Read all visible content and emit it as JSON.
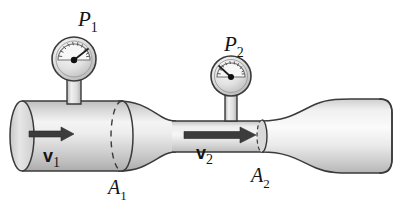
{
  "figure": {
    "background_color": "#ffffff",
    "width": 406,
    "height": 215
  },
  "labels": {
    "pressure_1": {
      "symbol": "P",
      "subscript": "1",
      "x": 78,
      "y": 22
    },
    "pressure_2": {
      "symbol": "P",
      "subscript": "2",
      "x": 224,
      "y": 47
    },
    "velocity_1": {
      "symbol": "v",
      "subscript": "1",
      "x": 43,
      "y": 160
    },
    "velocity_2": {
      "symbol": "v",
      "subscript": "2",
      "x": 196,
      "y": 157
    },
    "area_1": {
      "symbol": "A",
      "subscript": "1",
      "x": 108,
      "y": 190
    },
    "area_2": {
      "symbol": "A",
      "subscript": "2",
      "x": 253,
      "y": 178
    }
  },
  "gauges": [
    {
      "name": "pressure-gauge-1",
      "center_x": 74,
      "center_y": 59,
      "radius": 22,
      "needle_angle_deg": -35,
      "reading": "high",
      "stem_x": 74,
      "stem_top": 79,
      "stem_bottom": 104,
      "stem_half_width": 7
    },
    {
      "name": "pressure-gauge-2",
      "center_x": 231,
      "center_y": 76,
      "radius": 20,
      "needle_angle_deg": -145,
      "reading": "low",
      "stem_x": 231,
      "stem_top": 94,
      "stem_bottom": 120,
      "stem_half_width": 6
    }
  ],
  "pipe": {
    "fill_light": "#f2f2f2",
    "fill_mid": "#d8d8d8",
    "fill_dark": "#b4b4b4",
    "outline_color": "#3a3a3a",
    "wide_left_end_x": 22,
    "wide_section_right_x": 122,
    "wide_top_y": 101,
    "wide_bottom_y": 171,
    "throat_left_x": 172,
    "throat_right_x": 262,
    "throat_top_y": 121,
    "throat_bottom_y": 152,
    "flare_right_x": 392,
    "flare_top_y": 99,
    "flare_bottom_y": 173
  },
  "cross_sections": [
    {
      "name": "cross-section-a1",
      "cx": 122,
      "cy": 136,
      "rx": 11,
      "ry": 35,
      "front_style": "solid",
      "back_style": "dashed"
    },
    {
      "name": "cross-section-a2",
      "cx": 262,
      "cy": 136,
      "rx": 5,
      "ry": 16,
      "front_style": "solid",
      "back_style": "dashed"
    }
  ],
  "arrows": [
    {
      "name": "velocity-arrow-1",
      "x1": 29,
      "x2": 72,
      "y": 134,
      "thickness": 6,
      "head_length": 13,
      "head_half_width": 8,
      "color": "#3c3c3c"
    },
    {
      "name": "velocity-arrow-2",
      "x1": 184,
      "x2": 255,
      "y": 135,
      "thickness": 7,
      "head_length": 16,
      "head_half_width": 9,
      "color": "#3c3c3c"
    }
  ],
  "physics": {
    "principle": "Bernoulli / continuity",
    "relation_area": "A1 > A2",
    "relation_velocity": "v2 > v1",
    "relation_pressure": "P1 > P2"
  }
}
